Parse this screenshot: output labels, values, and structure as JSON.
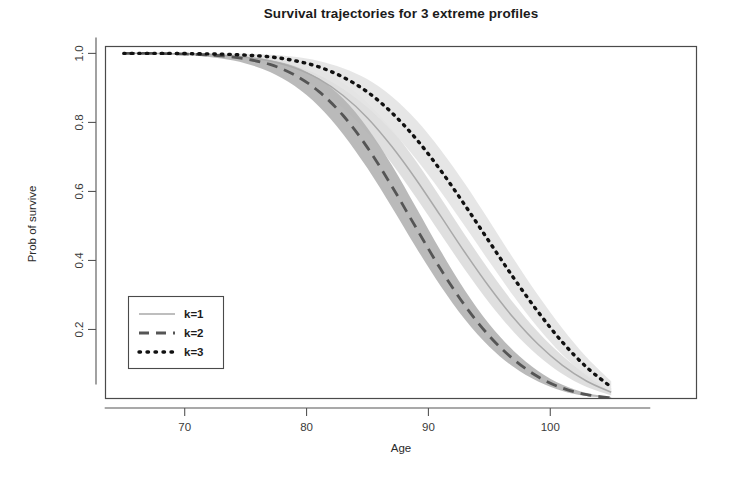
{
  "chart_data": {
    "type": "line",
    "title": "Survival trajectories for 3 extreme profiles",
    "xlabel": "Age",
    "ylabel": "Prob of survive",
    "xlim": [
      63.5,
      112.0
    ],
    "ylim": [
      0.0,
      1.02
    ],
    "xticks": [
      70,
      80,
      90,
      100
    ],
    "xtick_labels": [
      "70",
      "80",
      "90",
      "100"
    ],
    "yticks": [
      0.2,
      0.4,
      0.6,
      0.8,
      1.0
    ],
    "ytick_labels": [
      "0.2",
      "0.4",
      "0.6",
      "0.8",
      "1.0"
    ],
    "grid": false,
    "legend_position": "bottom-left",
    "has_confidence_bands": true,
    "x": [
      65,
      67,
      69,
      71,
      73,
      75,
      77,
      79,
      81,
      83,
      85,
      87,
      89,
      91,
      93,
      95,
      97,
      99,
      101,
      103,
      105
    ],
    "series": [
      {
        "name": "k=1",
        "label": "k=1",
        "style": "solid",
        "color": "#a9a9a9",
        "band_color": "#dcdcdc",
        "values": [
          1.0,
          1.0,
          0.999,
          0.998,
          0.995,
          0.989,
          0.978,
          0.958,
          0.926,
          0.878,
          0.813,
          0.73,
          0.634,
          0.529,
          0.423,
          0.323,
          0.233,
          0.157,
          0.096,
          0.05,
          0.018
        ],
        "band_lower": [
          0.999,
          0.999,
          0.997,
          0.994,
          0.989,
          0.98,
          0.964,
          0.937,
          0.897,
          0.841,
          0.769,
          0.681,
          0.582,
          0.477,
          0.373,
          0.277,
          0.193,
          0.124,
          0.071,
          0.033,
          0.009
        ],
        "band_upper": [
          1.0,
          1.0,
          1.0,
          1.0,
          0.999,
          0.996,
          0.99,
          0.977,
          0.953,
          0.914,
          0.857,
          0.78,
          0.687,
          0.582,
          0.474,
          0.371,
          0.276,
          0.193,
          0.124,
          0.07,
          0.03
        ]
      },
      {
        "name": "k=2",
        "label": "k=2",
        "style": "dashed",
        "color": "#555555",
        "band_color": "#b4b4b4",
        "values": [
          1.0,
          1.0,
          0.999,
          0.997,
          0.993,
          0.984,
          0.968,
          0.938,
          0.89,
          0.82,
          0.727,
          0.615,
          0.494,
          0.375,
          0.269,
          0.181,
          0.113,
          0.063,
          0.03,
          0.011,
          0.002
        ],
        "band_lower": [
          0.999,
          0.999,
          0.997,
          0.993,
          0.985,
          0.971,
          0.946,
          0.906,
          0.847,
          0.766,
          0.667,
          0.554,
          0.437,
          0.326,
          0.229,
          0.15,
          0.091,
          0.049,
          0.022,
          0.007,
          0.001
        ],
        "band_upper": [
          1.0,
          1.0,
          1.0,
          0.999,
          0.997,
          0.993,
          0.983,
          0.963,
          0.927,
          0.869,
          0.784,
          0.676,
          0.553,
          0.428,
          0.313,
          0.215,
          0.138,
          0.08,
          0.04,
          0.016,
          0.004
        ]
      },
      {
        "name": "k=3",
        "label": "k=3",
        "style": "dotted",
        "color": "#111111",
        "band_color": "#e4e4e4",
        "values": [
          1.0,
          1.0,
          1.0,
          0.999,
          0.998,
          0.995,
          0.99,
          0.979,
          0.961,
          0.931,
          0.888,
          0.828,
          0.752,
          0.661,
          0.56,
          0.454,
          0.349,
          0.251,
          0.163,
          0.09,
          0.033
        ],
        "band_lower": [
          1.0,
          0.999,
          0.999,
          0.998,
          0.995,
          0.99,
          0.981,
          0.964,
          0.937,
          0.897,
          0.843,
          0.775,
          0.693,
          0.6,
          0.499,
          0.396,
          0.296,
          0.205,
          0.127,
          0.065,
          0.019
        ],
        "band_upper": [
          1.0,
          1.0,
          1.0,
          1.0,
          1.0,
          0.999,
          0.996,
          0.99,
          0.978,
          0.957,
          0.925,
          0.875,
          0.807,
          0.721,
          0.622,
          0.514,
          0.404,
          0.299,
          0.203,
          0.119,
          0.05
        ]
      }
    ]
  },
  "legend": {
    "entries": [
      {
        "label": "k=1"
      },
      {
        "label": "k=2"
      },
      {
        "label": "k=3"
      }
    ]
  }
}
